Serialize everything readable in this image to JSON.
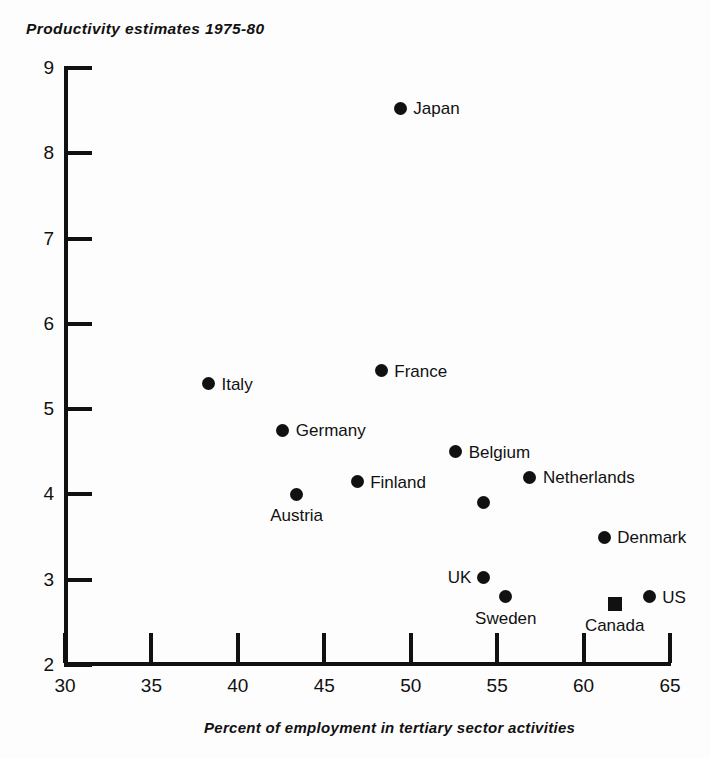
{
  "chart_data": {
    "type": "scatter",
    "title": "Productivity estimates 1975-80",
    "xlabel": "Percent of employment in tertiary sector activities",
    "ylabel": "",
    "xlim": [
      30,
      65
    ],
    "ylim": [
      2,
      9
    ],
    "xticks": [
      30,
      35,
      40,
      45,
      50,
      55,
      60,
      65
    ],
    "yticks": [
      2,
      3,
      4,
      5,
      6,
      7,
      8,
      9
    ],
    "grid": false,
    "legend": "none",
    "points": [
      {
        "label": "Japan",
        "x": 49.4,
        "y": 8.53,
        "marker": "circle",
        "label_pos": "right"
      },
      {
        "label": "France",
        "x": 48.3,
        "y": 5.45,
        "marker": "circle",
        "label_pos": "right"
      },
      {
        "label": "Italy",
        "x": 38.3,
        "y": 5.3,
        "marker": "circle",
        "label_pos": "right"
      },
      {
        "label": "Germany",
        "x": 42.6,
        "y": 4.75,
        "marker": "circle",
        "label_pos": "right"
      },
      {
        "label": "Belgium",
        "x": 52.6,
        "y": 4.5,
        "marker": "circle",
        "label_pos": "right"
      },
      {
        "label": "Netherlands",
        "x": 56.9,
        "y": 4.2,
        "marker": "circle",
        "label_pos": "right"
      },
      {
        "label": "Finland",
        "x": 46.9,
        "y": 4.15,
        "marker": "circle",
        "label_pos": "right"
      },
      {
        "label": "Austria",
        "x": 43.4,
        "y": 4.0,
        "marker": "circle",
        "label_pos": "below"
      },
      {
        "label": "",
        "x": 54.2,
        "y": 3.9,
        "marker": "circle",
        "label_pos": "right"
      },
      {
        "label": "Denmark",
        "x": 61.2,
        "y": 3.5,
        "marker": "circle",
        "label_pos": "right"
      },
      {
        "label": "UK",
        "x": 54.2,
        "y": 3.03,
        "marker": "circle",
        "label_pos": "left"
      },
      {
        "label": "US",
        "x": 63.8,
        "y": 2.8,
        "marker": "circle",
        "label_pos": "right"
      },
      {
        "label": "Sweden",
        "x": 55.5,
        "y": 2.8,
        "marker": "circle",
        "label_pos": "below"
      },
      {
        "label": "Canada",
        "x": 61.8,
        "y": 2.72,
        "marker": "square",
        "label_pos": "below"
      }
    ]
  },
  "colors": {
    "marker": "#111111",
    "axis": "#111111",
    "background": "#fdfdfd"
  }
}
